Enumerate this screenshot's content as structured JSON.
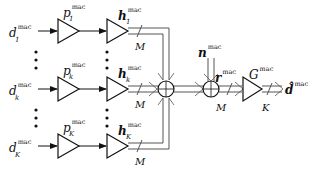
{
  "diagram": {
    "type": "block-diagram",
    "sup_label": "mac",
    "inputs": [
      {
        "symbol": "d",
        "sub": "1"
      },
      {
        "symbol": "d",
        "sub": "k"
      },
      {
        "symbol": "d",
        "sub": "K"
      }
    ],
    "precoders": [
      {
        "symbol": "p",
        "sub": "1"
      },
      {
        "symbol": "p",
        "sub": "k"
      },
      {
        "symbol": "p",
        "sub": "K"
      }
    ],
    "channels": [
      {
        "symbol": "h",
        "sub": "1"
      },
      {
        "symbol": "h",
        "sub": "k"
      },
      {
        "symbol": "h",
        "sub": "K"
      }
    ],
    "bus_width_labels": [
      "M",
      "M",
      "M",
      "M",
      "K"
    ],
    "noise": {
      "symbol": "n"
    },
    "received": {
      "symbol": "r"
    },
    "equalizer": {
      "symbol": "G"
    },
    "output": {
      "symbol": "d̂"
    },
    "ellipsis": "⋮"
  }
}
